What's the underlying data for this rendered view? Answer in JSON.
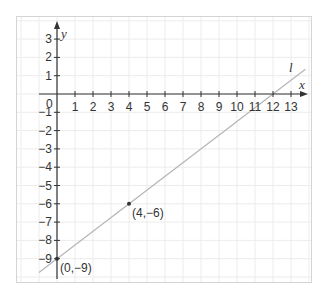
{
  "chart_data": {
    "type": "line",
    "title": "",
    "xlabel": "x",
    "ylabel": "y",
    "xlim": [
      -2,
      14
    ],
    "ylim": [
      -10,
      4
    ],
    "grid": true,
    "x_ticks": [
      1,
      2,
      3,
      4,
      5,
      6,
      7,
      8,
      9,
      10,
      11,
      12,
      13
    ],
    "y_ticks": [
      3,
      2,
      1,
      -1,
      -2,
      -3,
      -4,
      -5,
      -6,
      -7,
      -8,
      -9
    ],
    "origin_label": "0",
    "series": [
      {
        "name": "l",
        "equation": "y = 0.75x - 9",
        "slope": 0.75,
        "intercept": -9,
        "x": [
          -1,
          13.8
        ],
        "y": [
          -9.75,
          1.35
        ]
      }
    ],
    "points": [
      {
        "x": 0,
        "y": -9,
        "label": "(0,−9)"
      },
      {
        "x": 4,
        "y": -6,
        "label": "(4,−6)"
      }
    ],
    "annotations": [
      {
        "text": "l",
        "near": "upper end of line"
      }
    ]
  },
  "labels": {
    "x_axis": "x",
    "y_axis": "y",
    "line": "l",
    "origin": "0",
    "x_ticks": [
      "1",
      "2",
      "3",
      "4",
      "5",
      "6",
      "7",
      "8",
      "9",
      "10",
      "11",
      "12",
      "13"
    ],
    "y_ticks": [
      "3",
      "2",
      "1",
      "−1",
      "−2",
      "−3",
      "−4",
      "−5",
      "−6",
      "−7",
      "−8",
      "−9"
    ],
    "point_a": "(0,−9)",
    "point_b": "(4,−6)"
  }
}
